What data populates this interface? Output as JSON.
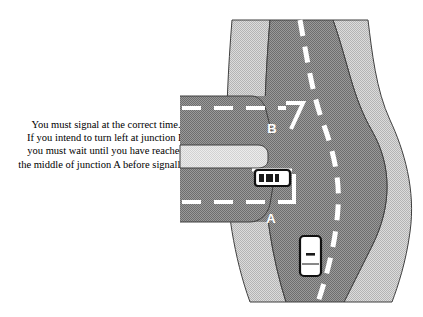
{
  "page": {
    "background_color": "#ffffff",
    "width": 423,
    "height": 317,
    "kind": "driving-theory-illustration"
  },
  "advice": {
    "line1": "You must signal at the correct time.",
    "line2": "If you intend to turn left at junction B",
    "line3": "you must wait until you have reached",
    "line4": "the middle of junction A before signalling"
  },
  "diagram": {
    "labels": {
      "junction_upper": "B",
      "junction_lower": "A"
    },
    "colors": {
      "carriageway": "#8a8a8a",
      "verge": "#c8c8c8",
      "island": "#d8d8d8",
      "lane_marking": "#ffffff",
      "outline": "#3a3a3a",
      "vehicle_body": "#ffffff",
      "vehicle_outline": "#111111",
      "label_color": "#ffffff"
    },
    "vehicles": [
      {
        "name": "car-in-side-road",
        "orientation": "horizontal",
        "position_note": "side road near junction A"
      },
      {
        "name": "car-on-main-road",
        "orientation": "vertical",
        "position_note": "main carriageway below junction A"
      }
    ]
  }
}
